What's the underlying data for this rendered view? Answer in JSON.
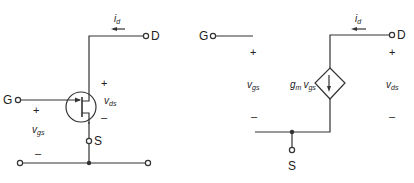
{
  "left_circuit": {
    "title": "JFET circuit symbol",
    "terminals": {
      "drain": "D",
      "gate": "G",
      "source": "S"
    },
    "current_label": {
      "main": "i",
      "sub": "d"
    },
    "vds_label": {
      "main": "v",
      "sub": "ds"
    },
    "vgs_label": {
      "main": "v",
      "sub": "gs"
    },
    "plus": "+",
    "minus": "–"
  },
  "right_circuit": {
    "title": "Small-signal equivalent circuit",
    "terminals": {
      "drain": "D",
      "gate": "G",
      "source": "S"
    },
    "current_label": {
      "main": "i",
      "sub": "d"
    },
    "source_label": {
      "gm": "g",
      "gm_sub": "m",
      "v": "v",
      "v_sub": "gs"
    },
    "vds_label": {
      "main": "v",
      "sub": "ds"
    },
    "vgs_label": {
      "main": "v",
      "sub": "gs"
    },
    "plus": "+",
    "minus": "–"
  },
  "colors": {
    "wire": "#333333",
    "text": "#222222",
    "background": "#ffffff"
  }
}
